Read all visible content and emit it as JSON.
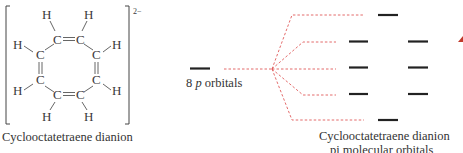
{
  "molecule": {
    "name": "Cyclooctatetraene dianion",
    "charge": "2−",
    "atoms": {
      "carbon": "C",
      "hydrogen": "H"
    },
    "double_bond": "="
  },
  "left_orbital": {
    "count": "8",
    "p_label": "p",
    "label_rest": "orbitals"
  },
  "mo_diagram": {
    "caption_line1": "Cyclooctatetraene dianion",
    "caption_line2": "pi molecular orbitals",
    "levels": [
      1,
      2,
      2,
      2,
      1
    ],
    "connector_color": "#e05a5a",
    "level_color": "#222222",
    "accent_marker_color": "#c0392b"
  }
}
